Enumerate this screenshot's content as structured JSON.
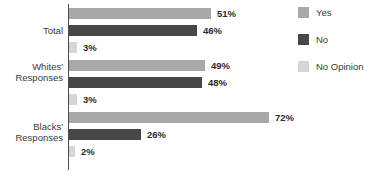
{
  "chart_data": {
    "type": "bar",
    "orientation": "horizontal",
    "title": "",
    "subtitle": "",
    "xlabel": "",
    "ylabel": "",
    "xlim": [
      0,
      72
    ],
    "grid": false,
    "legend_position": "right",
    "categories": [
      "Total",
      "Whites' Responses",
      "Blacks' Responses"
    ],
    "series": [
      {
        "name": "Yes",
        "color": "#a8a8a8",
        "values": [
          51,
          49,
          72
        ]
      },
      {
        "name": "No",
        "color": "#474747",
        "values": [
          46,
          48,
          26
        ]
      },
      {
        "name": "No Opinion",
        "color": "#d6d6d6",
        "values": [
          3,
          3,
          2
        ]
      }
    ],
    "value_labels": [
      [
        "51%",
        "46%",
        "3%"
      ],
      [
        "49%",
        "48%",
        "3%"
      ],
      [
        "72%",
        "26%",
        "2%"
      ]
    ]
  },
  "axis": {
    "label_total": "Total",
    "label_whites": "Whites'\nResponses",
    "label_blacks": "Blacks'\nResponses"
  },
  "legend": {
    "items": [
      {
        "label": "Yes",
        "color": "#a8a8a8"
      },
      {
        "label": "No",
        "color": "#474747"
      },
      {
        "label": "No Opinion",
        "color": "#d6d6d6"
      }
    ]
  }
}
